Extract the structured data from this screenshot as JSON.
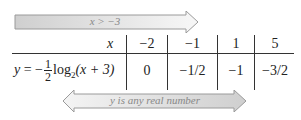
{
  "domain_arrow": {
    "label": "x > −3"
  },
  "range_arrow": {
    "label": "y is any real number"
  },
  "table": {
    "x_header": "x",
    "function_label": {
      "lhs": "y",
      "eq": " = −",
      "frac_num": "1",
      "frac_den": "2",
      "log": "log",
      "base": "2",
      "arg": "(x + 3)"
    },
    "x_values": [
      "−2",
      "−1",
      "1",
      "5"
    ],
    "y_values": [
      "0",
      "−1/2",
      "−1",
      "−3/2"
    ]
  },
  "colors": {
    "arrow_fill": "#d9d9d9",
    "arrow_stroke": "#999999",
    "line": "#333333"
  }
}
